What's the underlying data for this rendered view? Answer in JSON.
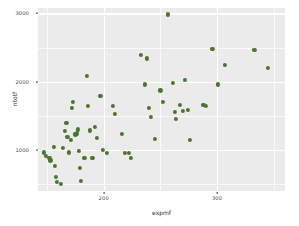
{
  "chart_data": {
    "type": "scatter",
    "title": "",
    "xlabel": "expmf",
    "ylabel": "ntotf",
    "xlim": [
      142,
      360
    ],
    "ylim": [
      395,
      3080
    ],
    "xticks": [
      200,
      300
    ],
    "yticks": [
      1000,
      2000,
      3000
    ],
    "xtick_labels": [
      "200",
      "300"
    ],
    "ytick_labels": [
      "1000",
      "2000",
      "3000"
    ],
    "x_minor_ticks": [
      150,
      250,
      350
    ],
    "y_minor_ticks": [
      500,
      1500,
      2500
    ],
    "grid": true,
    "legend": "none",
    "point_color": "#49752f",
    "panel_color": "#ebebeb",
    "grid_color": "#ffffff",
    "points": [
      {
        "x": 147,
        "y": 960
      },
      {
        "x": 149,
        "y": 905
      },
      {
        "x": 152,
        "y": 885
      },
      {
        "x": 153,
        "y": 845
      },
      {
        "x": 156,
        "y": 1045
      },
      {
        "x": 157,
        "y": 760
      },
      {
        "x": 158,
        "y": 600
      },
      {
        "x": 159,
        "y": 530
      },
      {
        "x": 162,
        "y": 505
      },
      {
        "x": 164,
        "y": 1030
      },
      {
        "x": 166,
        "y": 1275
      },
      {
        "x": 167,
        "y": 1390
      },
      {
        "x": 168,
        "y": 1185
      },
      {
        "x": 169,
        "y": 960
      },
      {
        "x": 171,
        "y": 1150
      },
      {
        "x": 172,
        "y": 1620
      },
      {
        "x": 173,
        "y": 1705
      },
      {
        "x": 175,
        "y": 1225
      },
      {
        "x": 176,
        "y": 1240
      },
      {
        "x": 177,
        "y": 1300
      },
      {
        "x": 178,
        "y": 985
      },
      {
        "x": 179,
        "y": 735
      },
      {
        "x": 180,
        "y": 545
      },
      {
        "x": 183,
        "y": 880
      },
      {
        "x": 185,
        "y": 2085
      },
      {
        "x": 186,
        "y": 1640
      },
      {
        "x": 188,
        "y": 1285
      },
      {
        "x": 190,
        "y": 885
      },
      {
        "x": 192,
        "y": 1330
      },
      {
        "x": 194,
        "y": 1175
      },
      {
        "x": 197,
        "y": 1795
      },
      {
        "x": 199,
        "y": 995
      },
      {
        "x": 203,
        "y": 955
      },
      {
        "x": 208,
        "y": 1640
      },
      {
        "x": 210,
        "y": 1530
      },
      {
        "x": 216,
        "y": 1230
      },
      {
        "x": 219,
        "y": 955
      },
      {
        "x": 222,
        "y": 950
      },
      {
        "x": 224,
        "y": 880
      },
      {
        "x": 233,
        "y": 2395
      },
      {
        "x": 236,
        "y": 1960
      },
      {
        "x": 238,
        "y": 2340
      },
      {
        "x": 240,
        "y": 1610
      },
      {
        "x": 242,
        "y": 1485
      },
      {
        "x": 245,
        "y": 1165
      },
      {
        "x": 250,
        "y": 1870
      },
      {
        "x": 252,
        "y": 1700
      },
      {
        "x": 257,
        "y": 2985
      },
      {
        "x": 261,
        "y": 1985
      },
      {
        "x": 263,
        "y": 1555
      },
      {
        "x": 264,
        "y": 1455
      },
      {
        "x": 267,
        "y": 1660
      },
      {
        "x": 270,
        "y": 1575
      },
      {
        "x": 272,
        "y": 2030
      },
      {
        "x": 274,
        "y": 1580
      },
      {
        "x": 276,
        "y": 1140
      },
      {
        "x": 288,
        "y": 1655
      },
      {
        "x": 290,
        "y": 1640
      },
      {
        "x": 296,
        "y": 2475
      },
      {
        "x": 301,
        "y": 1960
      },
      {
        "x": 307,
        "y": 2250
      },
      {
        "x": 333,
        "y": 2465
      },
      {
        "x": 345,
        "y": 2205
      }
    ]
  }
}
